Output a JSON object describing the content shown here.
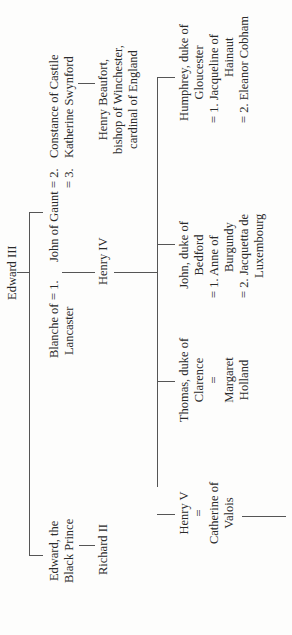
{
  "tree": {
    "root": "Edward III",
    "gen1": {
      "black_prince": [
        "Edward, the",
        "Black Prince"
      ],
      "richard_ii": "Richard II",
      "blanche": [
        "Blanche of",
        "Lancaster"
      ],
      "john_of_gaunt": "John of Gaunt",
      "marriage_1": "= 1.",
      "marriage_2": "= 2.",
      "marriage_3": "= 3.",
      "constance": "Constance of Castile",
      "katherine": "Katherine Swynford"
    },
    "gen2": {
      "henry_iv": "Henry IV",
      "henry_beaufort": [
        "Henry Beaufort,",
        "bishop of Winchester,",
        "cardinal of England"
      ]
    },
    "gen3": {
      "henry_v": "Henry V",
      "henry_v_eq": "=",
      "catherine": [
        "Catherine of",
        "Valois"
      ],
      "thomas": [
        "Thomas, duke of",
        "Clarence"
      ],
      "thomas_eq": "=",
      "margaret": [
        "Margaret",
        "Holland"
      ],
      "john_bedford": [
        "John, duke of",
        "Bedford"
      ],
      "bedford_m1": [
        "= 1. Anne of",
        "Burgundy"
      ],
      "bedford_m2": [
        "= 2. Jacquetta de",
        "Luxembourg"
      ],
      "humphrey": [
        "Humphrey, duke of",
        "Gloucester"
      ],
      "humphrey_m1": [
        "= 1. Jacqueline of",
        "Hainaut"
      ],
      "humphrey_m2": "= 2. Eleanor Cobham"
    }
  }
}
